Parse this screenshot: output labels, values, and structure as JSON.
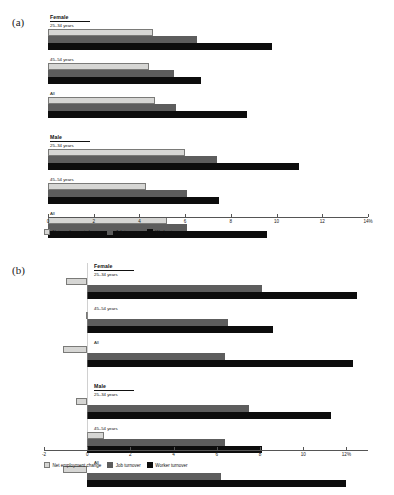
{
  "panels": [
    {
      "tag": "(a)"
    },
    {
      "tag": "(b)"
    }
  ],
  "legend": {
    "items": [
      {
        "label": "Net employment change",
        "color": "#d6d6d4",
        "key": "net"
      },
      {
        "label": "Job turnover",
        "color": "#5d5d5d",
        "key": "job"
      },
      {
        "label": "Worker turnover",
        "color": "#0d0d0d",
        "key": "worker"
      }
    ]
  },
  "sections": {
    "female": "Female",
    "male": "Male"
  },
  "group_labels": {
    "young": "25–34 years",
    "old": "45–54 years",
    "all": "All"
  },
  "chart_data": [
    {
      "type": "bar",
      "orientation": "horizontal",
      "panel": "(a)",
      "title": "",
      "xlabel": "%",
      "ylabel": "",
      "xlim": [
        0,
        14
      ],
      "xticks": [
        0,
        2,
        4,
        6,
        8,
        10,
        12,
        14
      ],
      "xticklabels": [
        "0",
        "2",
        "4",
        "6",
        "8",
        "10",
        "12",
        "14%"
      ],
      "grid": false,
      "legend_position": "bottom-left",
      "categories": [
        "Female 25–34 years",
        "Female 45–54 years",
        "Female All",
        "Male 25–34 years",
        "Male 45–54 years",
        "Male All"
      ],
      "series": [
        {
          "name": "Net employment change",
          "color": "#d6d6d4",
          "values": [
            4.6,
            4.4,
            4.7,
            6.0,
            4.3,
            5.2
          ]
        },
        {
          "name": "Job turnover",
          "color": "#5d5d5d",
          "values": [
            6.5,
            5.5,
            5.6,
            7.4,
            6.1,
            6.1
          ]
        },
        {
          "name": "Worker turnover",
          "color": "#0d0d0d",
          "values": [
            9.8,
            6.7,
            8.7,
            11.0,
            7.5,
            9.6
          ]
        }
      ]
    },
    {
      "type": "bar",
      "orientation": "horizontal",
      "panel": "(b)",
      "title": "",
      "xlabel": "%",
      "ylabel": "",
      "xlim": [
        -2,
        13
      ],
      "xticks": [
        -2,
        0,
        2,
        4,
        6,
        8,
        10,
        12
      ],
      "xticklabels": [
        "-2",
        "0",
        "2",
        "4",
        "6",
        "8",
        "10",
        "12%"
      ],
      "grid": false,
      "legend_position": "bottom-left",
      "categories": [
        "Female 25–34 years",
        "Female 45–54 years",
        "Female All",
        "Male 25–34 years",
        "Male 45–54 years",
        "Male All"
      ],
      "series": [
        {
          "name": "Net employment change",
          "color": "#d6d6d4",
          "values": [
            -1.0,
            -0.05,
            -1.1,
            -0.5,
            0.8,
            -1.1
          ]
        },
        {
          "name": "Job turnover",
          "color": "#5d5d5d",
          "values": [
            8.1,
            6.5,
            6.4,
            7.5,
            6.4,
            6.2
          ]
        },
        {
          "name": "Worker turnover",
          "color": "#0d0d0d",
          "values": [
            12.5,
            8.6,
            12.3,
            11.3,
            8.1,
            12.0
          ]
        }
      ]
    }
  ]
}
